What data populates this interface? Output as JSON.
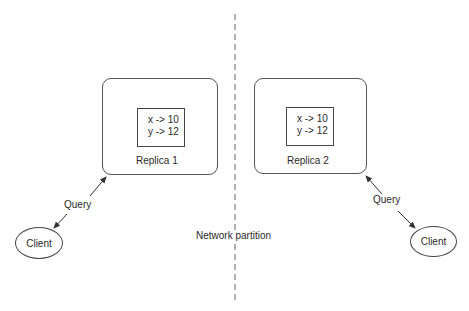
{
  "partition": {
    "label": "Network partition"
  },
  "replicas": [
    {
      "name": "Replica 1",
      "entries": [
        "x -> 10",
        "y -> 12"
      ]
    },
    {
      "name": "Replica 2",
      "entries": [
        "x -> 10",
        "y -> 12"
      ]
    }
  ],
  "clients": [
    {
      "label": "Client",
      "query_label": "Query"
    },
    {
      "label": "Client",
      "query_label": "Query"
    }
  ],
  "colors": {
    "stroke": "#444444",
    "dash": "#666666",
    "text": "#2a2a2a"
  }
}
